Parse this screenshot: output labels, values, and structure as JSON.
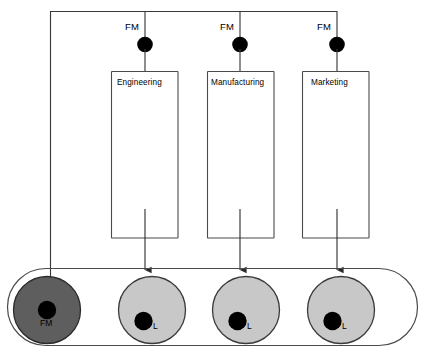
{
  "diagram": {
    "type": "organizational-matrix-diagram",
    "colors": {
      "line": "#3b3b3b",
      "dot": "#000000",
      "box_fill": "#ffffff",
      "box_stroke": "#4a4a4a",
      "pool_stroke": "#4a4a4a",
      "pool_fill": "#ffffff",
      "circle_dark_fill": "#5e5e5e",
      "circle_dark_stroke": "#2b2b2b",
      "circle_light_fill": "#c8c8c8",
      "circle_light_stroke": "#3a3a3a",
      "text": "#000000"
    },
    "bus": {
      "label_repeated": "FM",
      "branches": [
        {
          "label": "FM",
          "x": 145
        },
        {
          "label": "FM",
          "x": 240
        },
        {
          "label": "FM",
          "x": 337
        }
      ]
    },
    "departments": [
      {
        "name": "Engineering",
        "x": 111,
        "width": 67
      },
      {
        "name": "Manufacturing",
        "x": 207,
        "width": 67
      },
      {
        "name": "Marketing",
        "x": 302,
        "width": 67
      }
    ],
    "resource_pool": {
      "nodes": [
        {
          "label": "FM",
          "role": "functional-manager",
          "shade": "dark",
          "cx": 47,
          "cy": 310
        },
        {
          "label": "L",
          "role": "leader",
          "shade": "light",
          "cx": 152,
          "cy": 310
        },
        {
          "label": "L",
          "role": "leader",
          "shade": "light",
          "cx": 246,
          "cy": 310
        },
        {
          "label": "L",
          "role": "leader",
          "shade": "light",
          "cx": 341,
          "cy": 310
        }
      ]
    }
  }
}
